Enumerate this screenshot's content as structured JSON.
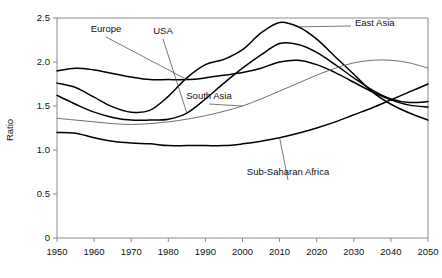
{
  "chart_data": {
    "type": "line",
    "title": "",
    "xlabel": "",
    "ylabel": "Ratio",
    "xlim": [
      1950,
      2050
    ],
    "ylim": [
      0,
      2.5
    ],
    "xticks": [
      1950,
      1960,
      1970,
      1980,
      1990,
      2000,
      2010,
      2020,
      2030,
      2040,
      2050
    ],
    "yticks": [
      "0",
      "0.5",
      "1.0",
      "1.5",
      "2.0",
      "2.5"
    ],
    "ytick_values": [
      0,
      0.5,
      1.0,
      1.5,
      2.0,
      2.5
    ],
    "grid": false,
    "legend": "inline-annotations",
    "x": [
      1950,
      1955,
      1960,
      1965,
      1970,
      1975,
      1980,
      1985,
      1990,
      1995,
      2000,
      2005,
      2010,
      2015,
      2020,
      2025,
      2030,
      2035,
      2040,
      2045,
      2050
    ],
    "series": [
      {
        "name": "Europe",
        "label": "Europe",
        "values": [
          1.9,
          1.93,
          1.91,
          1.87,
          1.83,
          1.8,
          1.8,
          1.8,
          1.82,
          1.85,
          1.88,
          1.93,
          2.0,
          2.02,
          1.97,
          1.88,
          1.77,
          1.66,
          1.57,
          1.51,
          1.49
        ],
        "color": "#000000"
      },
      {
        "name": "USA",
        "label": "USA",
        "values": [
          1.62,
          1.52,
          1.43,
          1.37,
          1.34,
          1.34,
          1.35,
          1.42,
          1.58,
          1.76,
          1.93,
          2.08,
          2.21,
          2.2,
          2.11,
          1.97,
          1.82,
          1.68,
          1.58,
          1.54,
          1.55
        ],
        "color": "#000000"
      },
      {
        "name": "East Asia",
        "label": "East Asia",
        "values": [
          1.76,
          1.71,
          1.6,
          1.49,
          1.43,
          1.45,
          1.61,
          1.82,
          1.97,
          2.03,
          2.14,
          2.33,
          2.45,
          2.4,
          2.26,
          2.06,
          1.86,
          1.66,
          1.52,
          1.42,
          1.34
        ],
        "color": "#000000"
      },
      {
        "name": "South Asia",
        "label": "South Asia",
        "values": [
          1.36,
          1.34,
          1.32,
          1.3,
          1.29,
          1.3,
          1.32,
          1.35,
          1.39,
          1.44,
          1.5,
          1.58,
          1.67,
          1.76,
          1.85,
          1.93,
          1.99,
          2.02,
          2.02,
          1.99,
          1.93
        ],
        "color": "#6f6f6f"
      },
      {
        "name": "Sub-Saharan Africa",
        "label": "Sub-Saharan Africa",
        "values": [
          1.2,
          1.19,
          1.14,
          1.1,
          1.08,
          1.07,
          1.05,
          1.05,
          1.05,
          1.05,
          1.07,
          1.1,
          1.14,
          1.19,
          1.25,
          1.32,
          1.4,
          1.48,
          1.57,
          1.66,
          1.75
        ],
        "color": "#000000"
      }
    ],
    "annotations": [
      {
        "text": "Europe",
        "series": "Europe"
      },
      {
        "text": "USA",
        "series": "USA"
      },
      {
        "text": "East Asia",
        "series": "East Asia"
      },
      {
        "text": "South Asia",
        "series": "South Asia"
      },
      {
        "text": "Sub-Saharan Africa",
        "series": "Sub-Saharan Africa"
      }
    ]
  }
}
